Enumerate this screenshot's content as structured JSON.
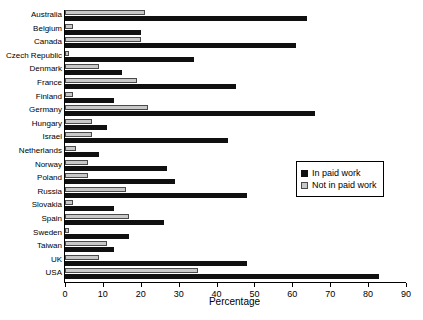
{
  "chart_data": {
    "type": "bar",
    "orientation": "horizontal",
    "title": "",
    "xlabel": "Percentage",
    "ylabel": "",
    "xlim": [
      0,
      90
    ],
    "xticks": [
      0,
      10,
      20,
      30,
      40,
      50,
      60,
      70,
      80,
      90
    ],
    "grid": false,
    "legend_position": "center-right",
    "categories": [
      "Australia",
      "Belgium",
      "Canada",
      "Czech Republic",
      "Denmark",
      "France",
      "Finland",
      "Germany",
      "Hungary",
      "Israel",
      "Netherlands",
      "Norway",
      "Poland",
      "Russia",
      "Slovakia",
      "Spain",
      "Sweden",
      "Taiwan",
      "UK",
      "USA"
    ],
    "series": [
      {
        "name": "In paid work",
        "color": "#101010",
        "values": [
          64,
          20,
          61,
          34,
          15,
          45,
          13,
          66,
          11,
          43,
          9,
          27,
          29,
          48,
          13,
          26,
          17,
          13,
          48,
          83
        ]
      },
      {
        "name": "Not in paid work",
        "color": "#c8c8c8",
        "values": [
          21,
          2,
          20,
          1,
          9,
          19,
          2,
          22,
          7,
          7,
          3,
          6,
          6,
          16,
          2,
          17,
          1,
          11,
          9,
          35
        ]
      }
    ]
  },
  "legend": {
    "items": [
      {
        "label": "In paid work",
        "swatch": "paid"
      },
      {
        "label": "Not in paid work",
        "swatch": "notpaid"
      }
    ]
  }
}
